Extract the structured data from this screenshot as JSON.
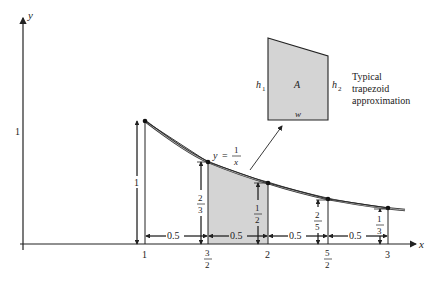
{
  "axes": {
    "x_label": "x",
    "y_label": "y",
    "y_tick": "1",
    "x_ticks": [
      {
        "num": "1",
        "den": null
      },
      {
        "num": "3",
        "den": "2"
      },
      {
        "num": "2",
        "den": null
      },
      {
        "num": "5",
        "den": "2"
      },
      {
        "num": "3",
        "den": null
      }
    ]
  },
  "curve": {
    "label_y": "y",
    "label_eq": "=",
    "label_num": "1",
    "label_den": "x",
    "points": [
      [
        1,
        1
      ],
      [
        1.5,
        0.6667
      ],
      [
        2,
        0.5
      ],
      [
        2.5,
        0.4
      ],
      [
        3,
        0.3333
      ]
    ]
  },
  "heights": [
    {
      "num": "1",
      "den": null
    },
    {
      "num": "2",
      "den": "3"
    },
    {
      "num": "1",
      "den": "2"
    },
    {
      "num": "2",
      "den": "5"
    },
    {
      "num": "1",
      "den": "3"
    }
  ],
  "widths": [
    "0.5",
    "0.5",
    "0.5",
    "0.5"
  ],
  "inset": {
    "h1": "h",
    "h1_sub": "1",
    "h2": "h",
    "h2_sub": "2",
    "area": "A",
    "width": "w",
    "caption": [
      "Typical",
      "trapezoid",
      "approximation"
    ]
  },
  "colors": {
    "shade": "#d4d4d4",
    "line": "#222222"
  }
}
